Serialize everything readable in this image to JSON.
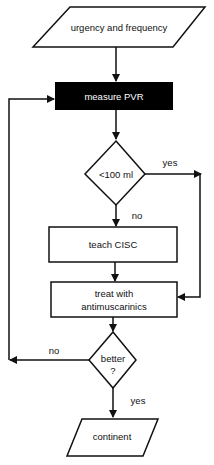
{
  "nodes": {
    "start": {
      "label": "urgency and frequency",
      "shape": "parallelogram"
    },
    "measure": {
      "label": "measure PVR",
      "shape": "rectangle",
      "fill": "#000000"
    },
    "decision1": {
      "label": "<100 ml",
      "shape": "diamond"
    },
    "teach": {
      "label": "teach CISC",
      "shape": "rectangle"
    },
    "treat": {
      "line1": "treat with",
      "line2": "antimuscarinics",
      "shape": "rectangle"
    },
    "decision2": {
      "line1": "better",
      "line2": "?",
      "shape": "diamond"
    },
    "end": {
      "label": "continent",
      "shape": "parallelogram"
    }
  },
  "edges": {
    "d1_yes": "yes",
    "d1_no": "no",
    "d2_no": "no",
    "d2_yes": "yes"
  },
  "colors": {
    "line": "#111111",
    "dark_box": "#000000",
    "background": "#ffffff"
  }
}
